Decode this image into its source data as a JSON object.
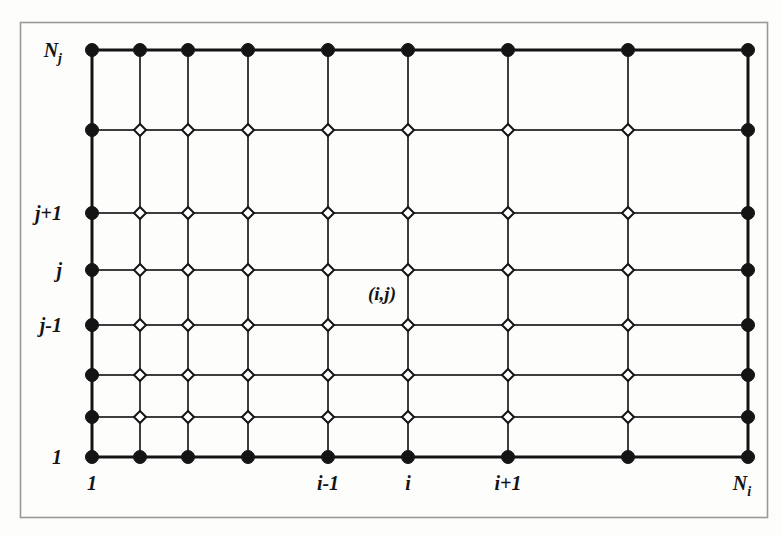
{
  "figure": {
    "frame": {
      "x": 20,
      "y": 22,
      "width": 748,
      "height": 496,
      "border_color": "#9a9a94",
      "background": "#fdfdfc"
    },
    "ink_color": "#141414",
    "node_fill_interior": "#ffffff"
  },
  "grid": {
    "columns": 10,
    "rows": 8,
    "column_x": [
      92,
      140,
      188,
      248,
      328,
      408,
      508,
      628,
      748,
      748
    ],
    "row_y": [
      50,
      130,
      213,
      270,
      325,
      375,
      417,
      457
    ],
    "x_positions": [
      92,
      140,
      188,
      248,
      328,
      408,
      508,
      628,
      748
    ],
    "y_positions": [
      50,
      130,
      213,
      270,
      325,
      375,
      417,
      457
    ],
    "boundary_node": {
      "shape": "filled-circle",
      "radius": 6.5,
      "fill": "#141414"
    },
    "interior_node": {
      "shape": "open-diamond",
      "radius": 6.0,
      "fill": "#ffffff",
      "stroke": "#141414"
    },
    "line_width_boundary": 3.0,
    "line_width_interior": 2.0
  },
  "labels": {
    "y_axis": [
      {
        "id": "y-top",
        "text": "N",
        "subscript": "j",
        "row_index": 0,
        "x": 62,
        "y": 50
      },
      {
        "id": "y-jplus1",
        "text": "j+1",
        "subscript": "",
        "row_index": 2,
        "x": 62,
        "y": 213
      },
      {
        "id": "y-j",
        "text": "j",
        "subscript": "",
        "row_index": 3,
        "x": 62,
        "y": 270
      },
      {
        "id": "y-jminus1",
        "text": "j-1",
        "subscript": "",
        "row_index": 4,
        "x": 62,
        "y": 325
      },
      {
        "id": "y-one",
        "text": "1",
        "subscript": "",
        "row_index": 7,
        "x": 62,
        "y": 457
      }
    ],
    "x_axis": [
      {
        "id": "x-one",
        "text": "1",
        "subscript": "",
        "col_index": 0,
        "x": 92,
        "y": 490
      },
      {
        "id": "x-iminus1",
        "text": "i-1",
        "subscript": "",
        "col_index": 4,
        "x": 328,
        "y": 490
      },
      {
        "id": "x-i",
        "text": "i",
        "subscript": "",
        "col_index": 5,
        "x": 408,
        "y": 490
      },
      {
        "id": "x-iplus1",
        "text": "i+1",
        "subscript": "",
        "col_index": 6,
        "x": 508,
        "y": 490
      },
      {
        "id": "x-right",
        "text": "N",
        "subscript": "i",
        "col_index": 8,
        "x": 742,
        "y": 490
      }
    ],
    "annotation": {
      "id": "node-ij",
      "text": "(i,j)",
      "x": 368,
      "y": 300
    }
  },
  "chart_data": {
    "type": "diagram",
    "xlabel": "",
    "ylabel": "",
    "nx": 10,
    "ny": 8,
    "x_tick_labels": [
      "1",
      "i-1",
      "i",
      "i+1",
      "Ni"
    ],
    "y_tick_labels": [
      "1",
      "j-1",
      "j",
      "j+1",
      "Nj"
    ],
    "annotations": [
      "(i,j)"
    ],
    "node_types": [
      "boundary: filled circle",
      "interior: open diamond"
    ],
    "grid": true,
    "legend": "none"
  }
}
